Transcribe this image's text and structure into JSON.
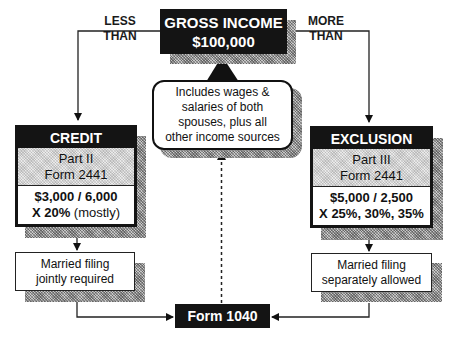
{
  "top": {
    "title": "GROSS INCOME",
    "amount": "$100,000"
  },
  "branches": {
    "left_label_line1": "LESS",
    "left_label_line2": "THAN",
    "right_label_line1": "MORE",
    "right_label_line2": "THAN"
  },
  "callout": {
    "lines": [
      "Includes wages &",
      "salaries of both",
      "spouses, plus all",
      "other income sources"
    ]
  },
  "credit": {
    "header": "CREDIT",
    "part": "Part II",
    "form": "Form 2441",
    "amounts": "$3,000 / 6,000",
    "rate": "X 20%",
    "rate_note": "(mostly)"
  },
  "exclusion": {
    "header": "EXCLUSION",
    "part": "Part III",
    "form": "Form 2441",
    "amounts": "$5,000 / 2,500",
    "rate": "X 25%, 30%, 35%"
  },
  "left_note": {
    "line1": "Married filing",
    "line2": "jointly required"
  },
  "right_note": {
    "line1": "Married filing",
    "line2": "separately allowed"
  },
  "bottom": {
    "label": "Form 1040"
  },
  "colors": {
    "box_fill": "#141414",
    "shadow": "#9a9a9a",
    "panel_gray": "#d4d4d4",
    "line": "#222222"
  }
}
